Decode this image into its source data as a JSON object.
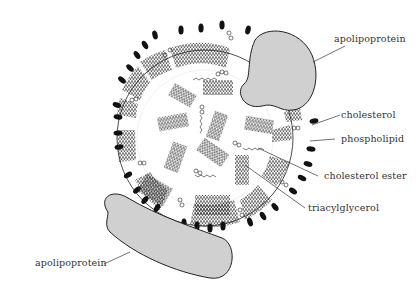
{
  "diagram": {
    "labels": {
      "apolipoprotein_top": "apolipoprotein",
      "cholesterol": "cholesterol",
      "phospholipid": "phospholipid",
      "cholesterol_ester": "cholesterol ester",
      "triacylglycerol": "triacylglycerol",
      "apolipoprotein_bottom": "apolipoprotein"
    },
    "colors": {
      "protein_fill": "#d0d0d0",
      "outline": "#222222",
      "head_group": "#111111",
      "text": "#333333"
    }
  }
}
